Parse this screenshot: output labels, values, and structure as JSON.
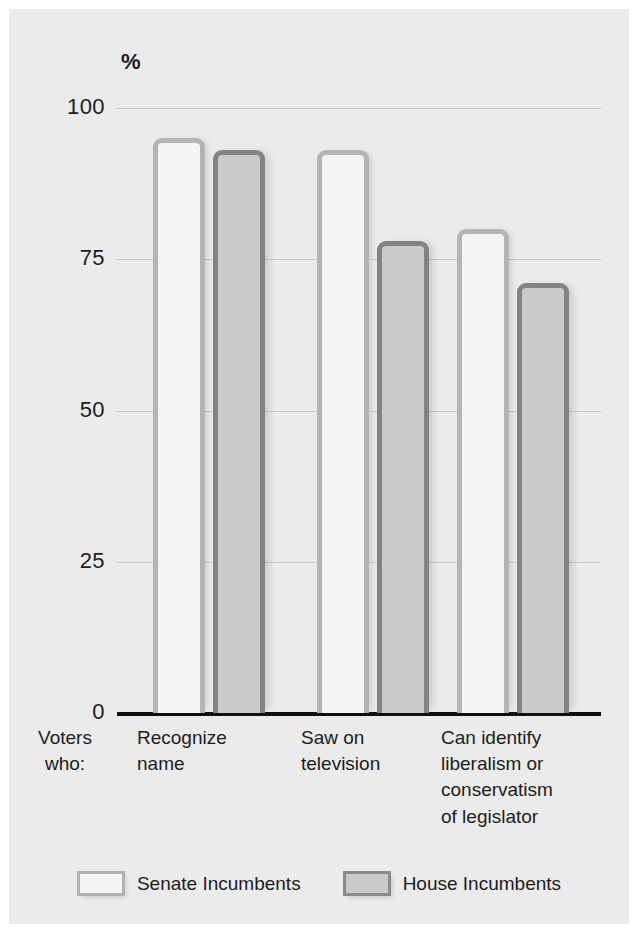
{
  "chart_data": {
    "type": "bar",
    "title": "",
    "subtitle": "",
    "xlabel": "Voters who:",
    "ylabel": "%",
    "ylim": [
      0,
      100
    ],
    "yticks": [
      0,
      25,
      50,
      75,
      100
    ],
    "ytick_labels": [
      "0",
      "25",
      "50",
      "75",
      "100"
    ],
    "grid": true,
    "legend_position": "bottom",
    "categories": [
      "Recognize\nname",
      "Saw on\ntelevision",
      "Can identify\nliberalism or\nconservatism\nof legislator"
    ],
    "series": [
      {
        "name": "Senate Incumbents",
        "values": [
          95,
          93,
          80
        ],
        "fill": "#f4f4f4",
        "edge": "#b4b4b4"
      },
      {
        "name": "House Incumbents",
        "values": [
          93,
          78,
          71
        ],
        "fill": "#cacaca",
        "edge": "#838383"
      }
    ]
  },
  "axis": {
    "percent_symbol": "%",
    "category_prefix": "Voters\nwho:"
  },
  "colors": {
    "page_background": "#ffffff",
    "panel_background": "#ebebeb",
    "gridline": "#c9c9c9",
    "axis_line": "#111111",
    "text": "#1c1c1c",
    "senate_fill": "#f4f4f4",
    "senate_edge": "#b4b4b4",
    "house_fill": "#cacaca",
    "house_edge": "#838383"
  }
}
